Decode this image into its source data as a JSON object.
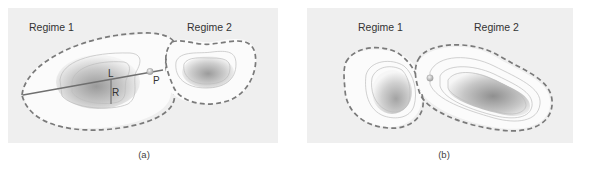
{
  "figure": {
    "panels": [
      {
        "id": "a",
        "caption": "(a)",
        "regime1_label": "Regime 1",
        "regime2_label": "Regime 2",
        "point_labels": {
          "L": "L",
          "R": "R",
          "P": "P"
        }
      },
      {
        "id": "b",
        "caption": "(b)",
        "regime1_label": "Regime 1",
        "regime2_label": "Regime 2"
      }
    ],
    "colors": {
      "panel_background": "#efefef",
      "boundary": "#7a7a7a",
      "line": "#6f6f6f",
      "contour": "#bdbdbd"
    }
  }
}
